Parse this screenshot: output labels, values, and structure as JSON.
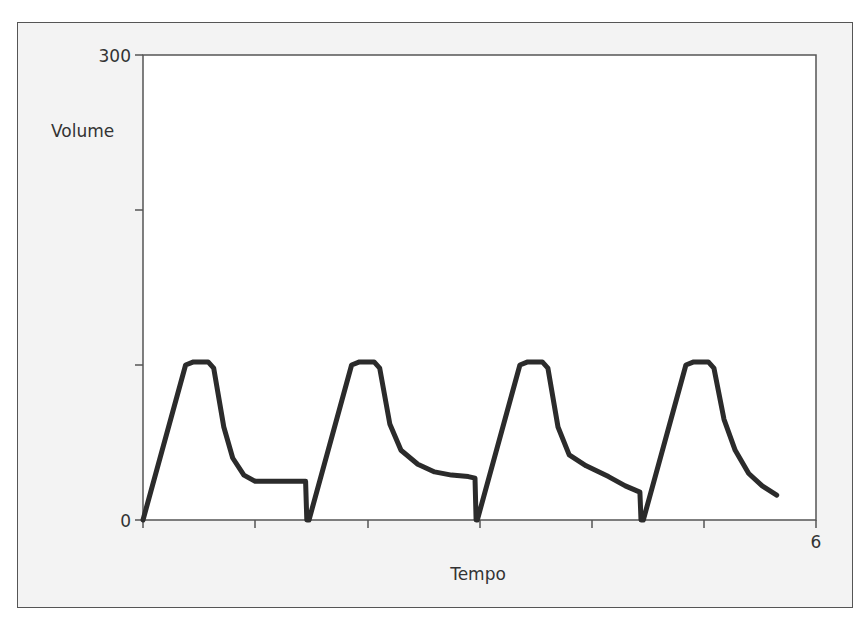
{
  "chart_data": {
    "type": "line",
    "title": "",
    "xlabel": "Tempo",
    "ylabel": "Volume",
    "xlim": [
      0,
      6
    ],
    "ylim": [
      0,
      300
    ],
    "x_tick_labels": {
      "0": "",
      "6": "6"
    },
    "y_tick_labels": {
      "0": "0",
      "300": "300"
    },
    "x_ticks": [
      0,
      1,
      2,
      3,
      4,
      5,
      6
    ],
    "y_ticks": [
      0,
      100,
      200,
      300
    ],
    "grid": false,
    "legend": null,
    "series": [
      {
        "name": "Volume",
        "color": "#2b2b2b",
        "points": [
          [
            0.0,
            0
          ],
          [
            0.38,
            100
          ],
          [
            0.45,
            102
          ],
          [
            0.58,
            102
          ],
          [
            0.63,
            98
          ],
          [
            0.72,
            60
          ],
          [
            0.8,
            40
          ],
          [
            0.9,
            29
          ],
          [
            1.0,
            25
          ],
          [
            1.1,
            25
          ],
          [
            1.3,
            25
          ],
          [
            1.45,
            25
          ],
          [
            1.46,
            0
          ],
          [
            1.48,
            0
          ],
          [
            1.86,
            100
          ],
          [
            1.93,
            102
          ],
          [
            2.06,
            102
          ],
          [
            2.11,
            98
          ],
          [
            2.2,
            62
          ],
          [
            2.3,
            45
          ],
          [
            2.45,
            36
          ],
          [
            2.6,
            31
          ],
          [
            2.75,
            29
          ],
          [
            2.9,
            28
          ],
          [
            2.96,
            27
          ],
          [
            2.97,
            0
          ],
          [
            2.98,
            0
          ],
          [
            3.36,
            100
          ],
          [
            3.43,
            102
          ],
          [
            3.56,
            102
          ],
          [
            3.61,
            98
          ],
          [
            3.7,
            60
          ],
          [
            3.8,
            42
          ],
          [
            3.95,
            35
          ],
          [
            4.15,
            28
          ],
          [
            4.3,
            22
          ],
          [
            4.43,
            18
          ],
          [
            4.44,
            0
          ],
          [
            4.46,
            0
          ],
          [
            4.84,
            100
          ],
          [
            4.91,
            102
          ],
          [
            5.04,
            102
          ],
          [
            5.09,
            98
          ],
          [
            5.18,
            65
          ],
          [
            5.28,
            45
          ],
          [
            5.4,
            30
          ],
          [
            5.52,
            22
          ],
          [
            5.65,
            16
          ]
        ]
      }
    ],
    "annotations": []
  },
  "labels": {
    "y_top": "300",
    "y_bottom": "0",
    "x_right": "6",
    "ylabel": "Volume",
    "xlabel": "Tempo"
  }
}
